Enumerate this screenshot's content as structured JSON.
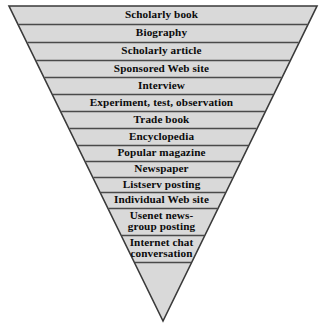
{
  "diagram": {
    "type": "inverted-pyramid",
    "title": "",
    "colors": {
      "fill": "#d9d9d9",
      "outline": "#3a3a3a",
      "divider": "#4a4a4a",
      "text": "#0b0b0b",
      "background": "#ffffff"
    },
    "geometry": {
      "apex_x": 163,
      "apex_y": 321,
      "top_left_x": 9,
      "top_right_x": 317,
      "top_y": 6
    },
    "tiers": [
      {
        "label": "Scholarly book",
        "top": 6,
        "bottom": 24,
        "lines": 1
      },
      {
        "label": "Biography",
        "top": 24,
        "bottom": 42,
        "lines": 1
      },
      {
        "label": "Scholarly article",
        "top": 42,
        "bottom": 60,
        "lines": 1
      },
      {
        "label": "Sponsored Web site",
        "top": 60,
        "bottom": 77,
        "lines": 1
      },
      {
        "label": "Interview",
        "top": 77,
        "bottom": 94,
        "lines": 1
      },
      {
        "label": "Experiment, test, observation",
        "top": 94,
        "bottom": 111,
        "lines": 1
      },
      {
        "label": "Trade book",
        "top": 111,
        "bottom": 128,
        "lines": 1
      },
      {
        "label": "Encyclopedia",
        "top": 128,
        "bottom": 145,
        "lines": 1
      },
      {
        "label": "Popular magazine",
        "top": 145,
        "bottom": 161,
        "lines": 1
      },
      {
        "label": "Newspaper",
        "top": 161,
        "bottom": 177,
        "lines": 1
      },
      {
        "label": "Listserv posting",
        "top": 177,
        "bottom": 192,
        "lines": 1
      },
      {
        "label": "Individual Web site",
        "top": 192,
        "bottom": 208,
        "lines": 1
      },
      {
        "label": "Usenet news-\ngroup posting",
        "top": 208,
        "bottom": 235,
        "lines": 2
      },
      {
        "label": "Internet chat\nconversation",
        "top": 235,
        "bottom": 262,
        "lines": 2
      }
    ]
  }
}
